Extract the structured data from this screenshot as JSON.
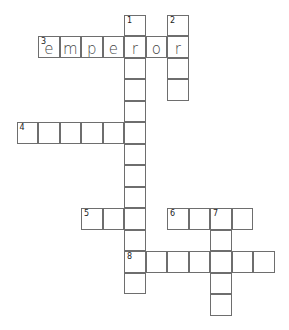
{
  "crossword": {
    "cell_size": 21.5,
    "origin": {
      "x": 16.5,
      "y": 14.5
    },
    "cells": [
      {
        "c": 5,
        "r": 0,
        "num": "1"
      },
      {
        "c": 7,
        "r": 0,
        "num": "2"
      },
      {
        "c": 1,
        "r": 1,
        "num": "3",
        "letter": "e"
      },
      {
        "c": 2,
        "r": 1,
        "letter": "m"
      },
      {
        "c": 3,
        "r": 1,
        "letter": "p"
      },
      {
        "c": 4,
        "r": 1,
        "letter": "e"
      },
      {
        "c": 5,
        "r": 1,
        "letter": "r"
      },
      {
        "c": 6,
        "r": 1,
        "letter": "o"
      },
      {
        "c": 7,
        "r": 1,
        "letter": "r"
      },
      {
        "c": 5,
        "r": 2
      },
      {
        "c": 7,
        "r": 2
      },
      {
        "c": 5,
        "r": 3
      },
      {
        "c": 7,
        "r": 3
      },
      {
        "c": 5,
        "r": 4
      },
      {
        "c": 0,
        "r": 5,
        "num": "4"
      },
      {
        "c": 1,
        "r": 5
      },
      {
        "c": 2,
        "r": 5
      },
      {
        "c": 3,
        "r": 5
      },
      {
        "c": 4,
        "r": 5
      },
      {
        "c": 5,
        "r": 5
      },
      {
        "c": 5,
        "r": 6
      },
      {
        "c": 5,
        "r": 7
      },
      {
        "c": 5,
        "r": 8
      },
      {
        "c": 3,
        "r": 9,
        "num": "5"
      },
      {
        "c": 4,
        "r": 9
      },
      {
        "c": 5,
        "r": 9
      },
      {
        "c": 7,
        "r": 9,
        "num": "6"
      },
      {
        "c": 8,
        "r": 9
      },
      {
        "c": 9,
        "r": 9,
        "num": "7"
      },
      {
        "c": 10,
        "r": 9
      },
      {
        "c": 5,
        "r": 10
      },
      {
        "c": 9,
        "r": 10
      },
      {
        "c": 5,
        "r": 11,
        "num": "8"
      },
      {
        "c": 6,
        "r": 11
      },
      {
        "c": 7,
        "r": 11
      },
      {
        "c": 8,
        "r": 11
      },
      {
        "c": 9,
        "r": 11
      },
      {
        "c": 10,
        "r": 11
      },
      {
        "c": 11,
        "r": 11
      },
      {
        "c": 5,
        "r": 12
      },
      {
        "c": 9,
        "r": 12
      },
      {
        "c": 9,
        "r": 13
      }
    ],
    "answers": {
      "3_across": "emperor"
    }
  }
}
